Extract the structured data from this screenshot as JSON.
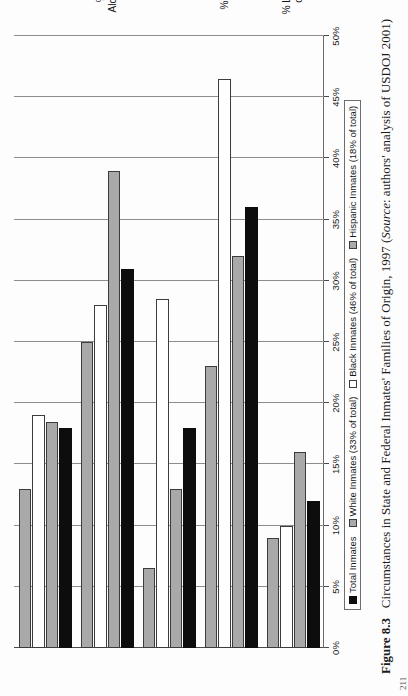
{
  "figure": {
    "number": "Figure 8.3",
    "title": "Circumstances in State and Federal Inmates' Families of Origin, 1997",
    "source_prefix": "Source",
    "source_text": ": authors' analysis of USDOJ 2001)",
    "source_open": "("
  },
  "chart_data": {
    "type": "bar",
    "orientation": "horizontal",
    "title": "Circumstances in State and Federal Inmates' Families of Origin, 1997",
    "xlabel": "",
    "ylabel": "",
    "grid": true,
    "legend_position": "bottom",
    "xlim": [
      0,
      50
    ],
    "ticks": [
      "0%",
      "5%",
      "10%",
      "15%",
      "20%",
      "25%",
      "30%",
      "35%",
      "40%",
      "45%",
      "50%"
    ],
    "categories": [
      "% Lived in Foster Home\nor Agency as Child",
      "% Parents on Welfare",
      "% Lived in Public\nHousing",
      "% Parents Abused\nAlcohol or Illegal Drugs",
      "% Parent Ever\nIncarcerated"
    ],
    "series": [
      {
        "name": "Total Inmates",
        "color": "#0d0d0d",
        "values": [
          12,
          36,
          18,
          31,
          18
        ]
      },
      {
        "name": "White Inmates (33% of total)",
        "color": "#a9a9a9",
        "values": [
          16,
          32,
          13,
          39,
          18.5
        ]
      },
      {
        "name": "Black Inmates (46% of total)",
        "color": "#ffffff",
        "values": [
          10,
          46.5,
          28.5,
          28,
          19
        ]
      },
      {
        "name": "Hispanic Inmates (18% of total)",
        "color": "#a9a9a9",
        "values": [
          9,
          23,
          6.5,
          25,
          13
        ]
      }
    ]
  },
  "page_number": "211"
}
